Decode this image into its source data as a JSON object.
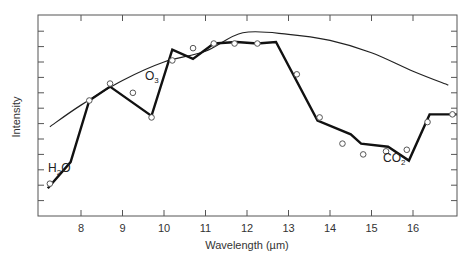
{
  "chart_data": {
    "type": "line",
    "title": "",
    "xlabel": "Wavelength (µm)",
    "ylabel": "Intensity",
    "xlim": [
      7.15,
      17.0
    ],
    "ylim": [
      0,
      13
    ],
    "x_ticks": [
      8,
      9,
      10,
      11,
      12,
      13,
      14,
      15,
      16
    ],
    "y_ticks_unlabeled": [
      1,
      2,
      3,
      4,
      5,
      6,
      7,
      8,
      9,
      10,
      11,
      12
    ],
    "grid": false,
    "legend": null,
    "series": [
      {
        "name": "Model spectrum (thick line)",
        "style": "line-thick",
        "x": [
          7.2,
          7.75,
          8.2,
          8.7,
          9.7,
          10.2,
          10.7,
          11.2,
          11.75,
          12.25,
          12.7,
          13.7,
          14.5,
          14.75,
          15.4,
          15.9,
          16.4,
          17.05
        ],
        "y": [
          1.8,
          3.5,
          7.5,
          8.4,
          6.5,
          10.8,
          10.2,
          11.2,
          11.3,
          11.2,
          11.3,
          6.2,
          5.3,
          4.7,
          4.5,
          3.6,
          6.6,
          6.6
        ]
      },
      {
        "name": "Observed (open circles)",
        "style": "scatter-open-circle",
        "x": [
          7.25,
          8.2,
          8.7,
          9.25,
          9.7,
          10.2,
          10.7,
          11.2,
          11.7,
          12.25,
          13.2,
          13.75,
          14.3,
          14.8,
          15.35,
          15.85,
          16.35,
          16.95
        ],
        "y": [
          2.1,
          7.5,
          8.6,
          8.0,
          6.4,
          10.1,
          10.9,
          11.2,
          11.2,
          11.2,
          9.2,
          6.4,
          4.7,
          4.0,
          4.2,
          4.3,
          6.1,
          6.6
        ]
      },
      {
        "name": "Blackbody envelope (thin curve)",
        "style": "line-thin",
        "x": [
          7.25,
          8.0,
          9.0,
          10.0,
          11.0,
          11.9,
          13.0,
          14.0,
          15.0,
          16.0,
          16.85
        ],
        "y": [
          5.8,
          7.2,
          8.8,
          10.0,
          10.7,
          11.9,
          11.8,
          11.4,
          10.6,
          9.4,
          8.5
        ]
      }
    ],
    "annotations": [
      {
        "text": "H₂O",
        "x": 7.3,
        "y": 5.0
      },
      {
        "text": "O₃",
        "x": 9.6,
        "y": 8.6
      },
      {
        "text": "CO₂",
        "x": 15.3,
        "y": 5.4
      }
    ]
  },
  "labels": {
    "xlabel": "Wavelength (µm)",
    "ylabel": "Intensity",
    "h2o_main": "H",
    "h2o_sub": "2",
    "h2o_end": "O",
    "o3_main": "O",
    "o3_sub": "3",
    "co2_main": "CO",
    "co2_sub": "2"
  }
}
